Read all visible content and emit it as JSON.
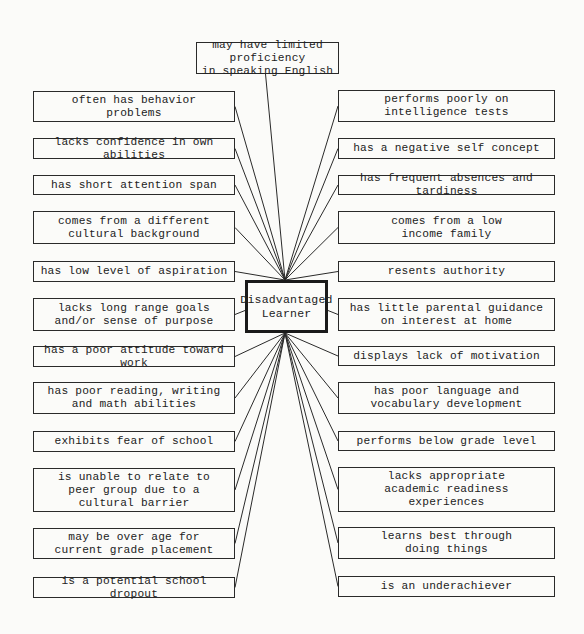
{
  "diagram": {
    "center": "Disadvantaged\nLearner",
    "top": "may have limited proficiency\nin speaking English",
    "left": [
      "often has behavior\nproblems",
      "lacks confidence in own abilities",
      "has short attention span",
      "comes from a different\ncultural background",
      "has low level of aspiration",
      "lacks long range goals\nand/or sense of purpose",
      "has a poor attitude toward work",
      "has poor reading, writing\nand math abilities",
      "exhibits fear of school",
      "is unable to relate to\npeer group due to a\ncultural barrier",
      "may be over age for\ncurrent grade placement",
      "is a potential school dropout"
    ],
    "right": [
      "performs poorly on\nintelligence tests",
      "has a negative self concept",
      "has frequent absences and tardiness",
      "comes from a low\nincome family",
      "resents authority",
      "has little parental guidance\non interest at home",
      "displays lack of motivation",
      "has poor language and\nvocabulary development",
      "performs below grade level",
      "lacks appropriate\nacademic readiness\nexperiences",
      "learns best through\ndoing things",
      "is an underachiever"
    ]
  }
}
